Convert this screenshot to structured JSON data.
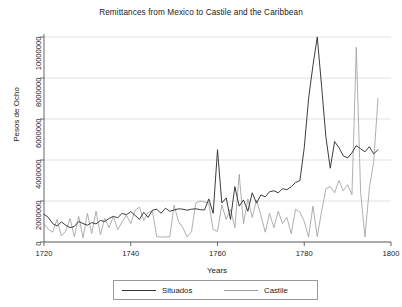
{
  "chart_data": {
    "type": "line",
    "title": "Remittances from Mexico to Castile and the Caribbean",
    "xlabel": "Years",
    "ylabel": "Pesos de Ocho",
    "xlim": [
      1720,
      1800
    ],
    "ylim": [
      0,
      10000000
    ],
    "grid": true,
    "legend_position": "bottom",
    "xticks": [
      1720,
      1740,
      1760,
      1780,
      1800
    ],
    "xtick_labels": [
      "1720",
      "1740",
      "1760",
      "1780",
      "1800"
    ],
    "yticks": [
      0,
      2000000,
      4000000,
      6000000,
      8000000,
      10000000
    ],
    "ytick_labels": [
      "0",
      "2000000",
      "4000000",
      "6000000",
      "8000000",
      "10000000"
    ],
    "colors": {
      "situados": "#333333",
      "castile": "#9a9a9a",
      "grid": "#d9d9d9",
      "axis": "#555555"
    },
    "x": [
      1720,
      1721,
      1722,
      1723,
      1724,
      1725,
      1726,
      1727,
      1728,
      1729,
      1730,
      1731,
      1732,
      1733,
      1734,
      1735,
      1736,
      1737,
      1738,
      1739,
      1740,
      1741,
      1742,
      1743,
      1744,
      1745,
      1746,
      1747,
      1748,
      1749,
      1750,
      1751,
      1752,
      1753,
      1754,
      1755,
      1756,
      1757,
      1758,
      1759,
      1760,
      1761,
      1762,
      1763,
      1764,
      1765,
      1766,
      1767,
      1768,
      1769,
      1770,
      1771,
      1772,
      1773,
      1774,
      1775,
      1776,
      1777,
      1778,
      1779,
      1780,
      1781,
      1782,
      1783,
      1784,
      1785,
      1786,
      1787,
      1788,
      1789,
      1790,
      1791,
      1792,
      1793,
      1794,
      1795,
      1796,
      1797
    ],
    "series": [
      {
        "name": "Situados",
        "values": [
          1350000,
          1200000,
          900000,
          780000,
          980000,
          820000,
          700000,
          760000,
          1000000,
          900000,
          820000,
          950000,
          880000,
          1050000,
          1000000,
          1150000,
          1250000,
          1180000,
          1400000,
          1330000,
          1480000,
          1300000,
          1100000,
          1450000,
          1200000,
          1550000,
          1600000,
          1400000,
          1650000,
          1500000,
          1560000,
          1620000,
          1600000,
          1550000,
          1600000,
          1620000,
          1580000,
          1560000,
          2100000,
          1400000,
          4500000,
          1900000,
          2150000,
          1100000,
          2700000,
          1750000,
          2050000,
          1500000,
          2400000,
          1900000,
          2300000,
          2200000,
          2450000,
          2500000,
          2400000,
          2600000,
          2550000,
          2700000,
          2900000,
          3000000,
          4600000,
          7000000,
          8600000,
          10000000,
          7600000,
          5100000,
          3600000,
          4900000,
          4600000,
          4200000,
          4100000,
          4350000,
          4700000,
          4550000,
          4400000,
          4650000,
          4300000,
          4500000
        ]
      },
      {
        "name": "Castile",
        "values": [
          900000,
          620000,
          480000,
          1100000,
          300000,
          520000,
          1150000,
          260000,
          1250000,
          200000,
          1400000,
          420000,
          1500000,
          360000,
          1150000,
          700000,
          1250000,
          600000,
          980000,
          1300000,
          900000,
          1550000,
          1700000,
          1050000,
          1450000,
          1500000,
          260000,
          240000,
          250000,
          250000,
          1800000,
          1000000,
          700000,
          250000,
          500000,
          1900000,
          2000000,
          1950000,
          1900000,
          600000,
          520000,
          1800000,
          1100000,
          1600000,
          700000,
          3300000,
          900000,
          2100000,
          1200000,
          2050000,
          1300000,
          480000,
          1400000,
          700000,
          1500000,
          900000,
          1200000,
          400000,
          1600000,
          1450000,
          1000000,
          250000,
          1750000,
          260000,
          1500000,
          2600000,
          2700000,
          2400000,
          3000000,
          2500000,
          2800000,
          2300000,
          9500000,
          2400000,
          250000,
          2600000,
          3900000,
          7000000
        ]
      }
    ]
  },
  "legend": {
    "entries": [
      {
        "label": "Situados"
      },
      {
        "label": "Castile"
      }
    ]
  }
}
